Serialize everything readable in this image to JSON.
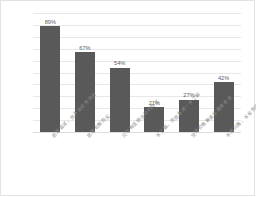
{
  "chart_data": {
    "type": "bar",
    "title": "",
    "subtitle": "",
    "xlabel": "",
    "ylabel": "",
    "categories": [
      "愿意尝试，但不会经常购买",
      "愿意长期购买",
      "只在有促销活动时购买",
      "不了解，但愿意进一步了解",
      "觉得价格偏高会谨慎考虑",
      "不感兴趣，不会购买"
    ],
    "values": [
      89,
      67,
      54,
      21,
      27,
      42
    ],
    "value_labels": [
      "89%",
      "67%",
      "54%",
      "21%",
      "27%",
      "42%"
    ],
    "ylim": [
      0,
      100
    ],
    "yticks": [
      0,
      10,
      20,
      30,
      40,
      50,
      60,
      70,
      80,
      90,
      100
    ],
    "ytick_labels": [
      "0%",
      "10%",
      "20%",
      "30%",
      "40%",
      "50%",
      "60%",
      "70%",
      "80%",
      "90%",
      "100%"
    ],
    "grid": true,
    "grid_axis": "y",
    "legend": false,
    "legend_position": "none",
    "bar_color": "#595959",
    "grid_color": "#e8e8e8",
    "tick_text_color": "#7a7a7a",
    "value_text_color": "#5c5c5c",
    "background_color": "#ffffff",
    "border_color": "#e3e3e3"
  }
}
